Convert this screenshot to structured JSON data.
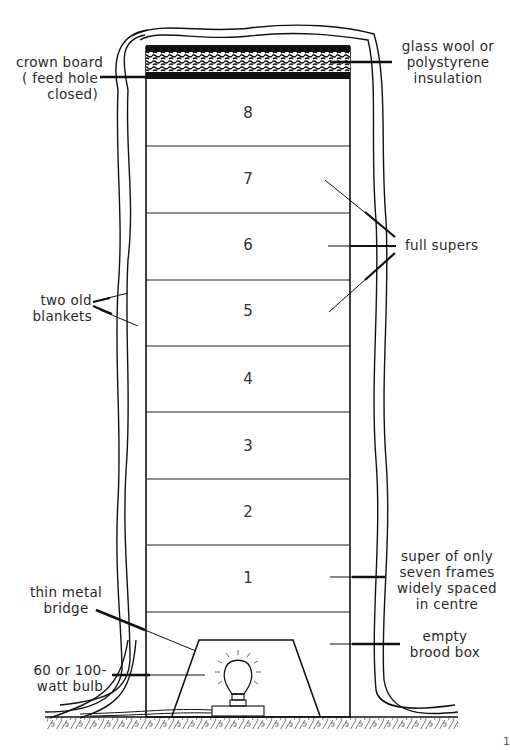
{
  "diagram": {
    "type": "labelled cross-section of stacked hive with heater",
    "boxes": [
      {
        "id": "8",
        "label": "8"
      },
      {
        "id": "7",
        "label": "7"
      },
      {
        "id": "6",
        "label": "6"
      },
      {
        "id": "5",
        "label": "5"
      },
      {
        "id": "4",
        "label": "4"
      },
      {
        "id": "3",
        "label": "3"
      },
      {
        "id": "2",
        "label": "2"
      },
      {
        "id": "1",
        "label": "1"
      }
    ],
    "labels": {
      "crown_board": "crown board\n( feed hole\nclosed)",
      "insulation": "glass wool or\npolystyrene\ninsulation",
      "full_supers": "full supers",
      "blankets": "two old\nblankets",
      "super_seven": "super of only\nseven frames\nwidely spaced\nin centre",
      "bridge": "thin metal\nbridge",
      "brood_box": "empty\nbrood box",
      "bulb": "60 or 100-\nwatt bulb"
    },
    "page_number": "1",
    "colors": {
      "line": "#111111",
      "background": "#ffffff",
      "text": "#2a2a2a"
    }
  }
}
